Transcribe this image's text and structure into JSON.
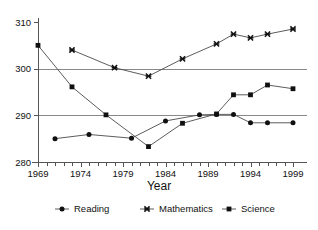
{
  "chart_data": {
    "type": "line",
    "title": "",
    "xlabel": "Year",
    "ylabel": "",
    "xlim": [
      1969,
      1999
    ],
    "ylim": [
      280,
      310
    ],
    "grid": true,
    "gridlines_y": [
      290,
      300
    ],
    "legend_position": "bottom",
    "x_tick_labels": [
      "1969",
      "1974",
      "1979",
      "1984",
      "1989",
      "1994",
      "1999"
    ],
    "x_tick_values": [
      1969,
      1974,
      1979,
      1984,
      1989,
      1994,
      1999
    ],
    "x_minor_ticks_every": 1,
    "y_tick_labels": [
      "280",
      "290",
      "300",
      "310"
    ],
    "y_tick_values": [
      280,
      290,
      300,
      310
    ],
    "series": [
      {
        "name": "Reading",
        "marker": "circle",
        "x": [
          1971,
          1975,
          1980,
          1984,
          1988,
          1990,
          1992,
          1994,
          1996,
          1999
        ],
        "values": [
          285.0,
          285.9,
          285.1,
          288.8,
          290.1,
          290.2,
          290.2,
          288.4,
          288.4,
          288.4
        ]
      },
      {
        "name": "Mathematics",
        "marker": "cross",
        "x": [
          1973,
          1978,
          1982,
          1986,
          1990,
          1992,
          1994,
          1996,
          1999
        ],
        "values": [
          304.0,
          300.2,
          298.4,
          302.1,
          305.3,
          307.4,
          306.6,
          307.4,
          308.5
        ]
      },
      {
        "name": "Science",
        "marker": "square",
        "x": [
          1969,
          1973,
          1977,
          1982,
          1986,
          1990,
          1992,
          1994,
          1996,
          1999
        ],
        "values": [
          305.0,
          296.1,
          290.1,
          283.3,
          288.3,
          290.3,
          294.4,
          294.4,
          296.5,
          295.7
        ]
      }
    ]
  },
  "legend": {
    "entries": [
      {
        "label": "Reading",
        "marker": "circle"
      },
      {
        "label": "Mathematics",
        "marker": "cross"
      },
      {
        "label": "Science",
        "marker": "square"
      }
    ]
  },
  "axis": {
    "x_title": "Year"
  }
}
